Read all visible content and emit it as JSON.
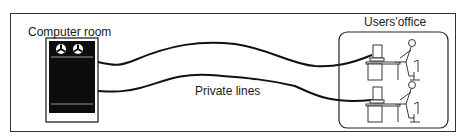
{
  "diagram": {
    "computer_room": {
      "label": "Computer room"
    },
    "users_office": {
      "label": "Users'office",
      "workstations": 2
    },
    "connection": {
      "label": "Private lines",
      "line_count": 2
    }
  },
  "colors": {
    "line": "#111111",
    "cabinet": "#0d0d0d",
    "border": "#333333"
  }
}
